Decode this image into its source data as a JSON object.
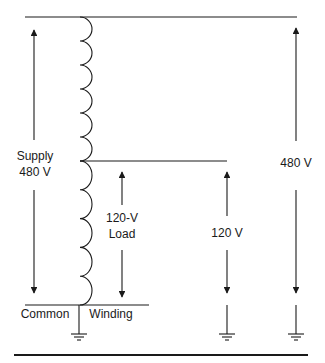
{
  "diagram": {
    "type": "autotransformer-schematic",
    "stroke_color": "#1a1a1a",
    "labels": {
      "supply_line1": "Supply",
      "supply_line2": "480 V",
      "load_line1": "120-V",
      "load_line2": "Load",
      "tap_voltage": "120 V",
      "full_voltage": "480 V",
      "common": "Common",
      "winding": "Winding"
    },
    "coil": {
      "upper_loops": 6,
      "lower_loops": 5
    },
    "grounds": [
      "common-ground",
      "tap-ground",
      "full-ground"
    ]
  }
}
